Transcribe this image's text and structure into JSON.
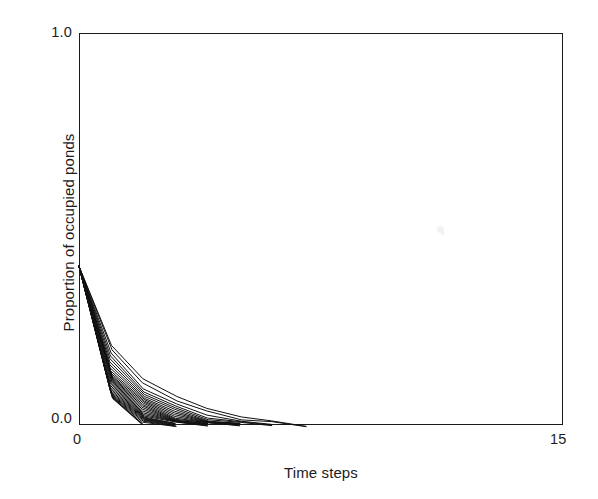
{
  "figure": {
    "background_color": "#ffffff",
    "ink_color": "#1a1a1a"
  },
  "axis": {
    "y_tick_top": "1.0",
    "y_tick_bottom": "0.0",
    "x_tick_left": "0",
    "x_tick_right": "15",
    "y_title": "Proportion of occupied ponds",
    "x_title": "Time steps"
  },
  "chart_data": {
    "type": "line",
    "title": "",
    "subtitle": "",
    "xlabel": "Time steps",
    "ylabel": "Proportion of occupied ponds",
    "xlim": [
      0,
      15
    ],
    "ylim": [
      0,
      1.0
    ],
    "x_ticks": [
      0,
      15
    ],
    "x_tick_labels": [
      "0",
      "15"
    ],
    "y_ticks": [
      0.0,
      1.0
    ],
    "y_tick_labels": [
      "0.0",
      "1.0"
    ],
    "grid": false,
    "legend": null,
    "legend_position": "none",
    "line_color": "#111111",
    "line_width": 1.0,
    "annotations": [],
    "x": [
      0,
      1,
      2,
      3,
      4,
      5,
      6,
      7,
      8,
      9,
      10,
      11,
      12,
      13,
      14,
      15
    ],
    "series": [
      {
        "name": "replicate 1",
        "values": [
          0.405,
          0.18,
          0.095,
          0.052,
          0.026,
          0.01,
          0.0,
          0,
          0,
          0,
          0,
          0,
          0,
          0,
          0,
          0
        ]
      },
      {
        "name": "replicate 2",
        "values": [
          0.405,
          0.172,
          0.088,
          0.045,
          0.02,
          0.007,
          0.0,
          0,
          0,
          0,
          0,
          0,
          0,
          0,
          0,
          0
        ]
      },
      {
        "name": "replicate 3",
        "values": [
          0.405,
          0.165,
          0.082,
          0.04,
          0.017,
          0.004,
          0.0,
          0,
          0,
          0,
          0,
          0,
          0,
          0,
          0,
          0
        ]
      },
      {
        "name": "replicate 4",
        "values": [
          0.405,
          0.158,
          0.076,
          0.036,
          0.014,
          0.0,
          0.0,
          0,
          0,
          0,
          0,
          0,
          0,
          0,
          0,
          0
        ]
      },
      {
        "name": "replicate 5",
        "values": [
          0.405,
          0.152,
          0.07,
          0.032,
          0.012,
          0.0,
          0.0,
          0,
          0,
          0,
          0,
          0,
          0,
          0,
          0,
          0
        ]
      },
      {
        "name": "replicate 6",
        "values": [
          0.405,
          0.146,
          0.065,
          0.029,
          0.01,
          0.0,
          0.0,
          0,
          0,
          0,
          0,
          0,
          0,
          0,
          0,
          0
        ]
      },
      {
        "name": "replicate 7",
        "values": [
          0.405,
          0.14,
          0.06,
          0.026,
          0.008,
          0.0,
          0.0,
          0,
          0,
          0,
          0,
          0,
          0,
          0,
          0,
          0
        ]
      },
      {
        "name": "replicate 8",
        "values": [
          0.405,
          0.135,
          0.056,
          0.023,
          0.006,
          0.0,
          0.0,
          0,
          0,
          0,
          0,
          0,
          0,
          0,
          0,
          0
        ]
      },
      {
        "name": "replicate 9",
        "values": [
          0.405,
          0.13,
          0.052,
          0.02,
          0.004,
          0.0,
          0.0,
          0,
          0,
          0,
          0,
          0,
          0,
          0,
          0,
          0
        ]
      },
      {
        "name": "replicate 10",
        "values": [
          0.405,
          0.126,
          0.048,
          0.018,
          0.003,
          0.0,
          0.0,
          0,
          0,
          0,
          0,
          0,
          0,
          0,
          0,
          0
        ]
      },
      {
        "name": "replicate 11",
        "values": [
          0.405,
          0.122,
          0.045,
          0.016,
          0.0,
          0.0,
          0.0,
          0,
          0,
          0,
          0,
          0,
          0,
          0,
          0,
          0
        ]
      },
      {
        "name": "replicate 12",
        "values": [
          0.405,
          0.118,
          0.042,
          0.014,
          0.0,
          0.0,
          0.0,
          0,
          0,
          0,
          0,
          0,
          0,
          0,
          0,
          0
        ]
      },
      {
        "name": "replicate 13",
        "values": [
          0.405,
          0.114,
          0.039,
          0.012,
          0.0,
          0.0,
          0.0,
          0,
          0,
          0,
          0,
          0,
          0,
          0,
          0,
          0
        ]
      },
      {
        "name": "replicate 14",
        "values": [
          0.405,
          0.11,
          0.036,
          0.01,
          0.0,
          0.0,
          0.0,
          0,
          0,
          0,
          0,
          0,
          0,
          0,
          0,
          0
        ]
      },
      {
        "name": "replicate 15",
        "values": [
          0.405,
          0.107,
          0.033,
          0.008,
          0.0,
          0.0,
          0.0,
          0,
          0,
          0,
          0,
          0,
          0,
          0,
          0,
          0
        ]
      },
      {
        "name": "replicate 16",
        "values": [
          0.405,
          0.104,
          0.03,
          0.006,
          0.0,
          0.0,
          0.0,
          0,
          0,
          0,
          0,
          0,
          0,
          0,
          0,
          0
        ]
      },
      {
        "name": "replicate 17",
        "values": [
          0.405,
          0.101,
          0.027,
          0.004,
          0.0,
          0.0,
          0.0,
          0,
          0,
          0,
          0,
          0,
          0,
          0,
          0,
          0
        ]
      },
      {
        "name": "replicate 18",
        "values": [
          0.405,
          0.098,
          0.024,
          0.0,
          0.0,
          0.0,
          0.0,
          0,
          0,
          0,
          0,
          0,
          0,
          0,
          0,
          0
        ]
      },
      {
        "name": "replicate 19",
        "values": [
          0.405,
          0.095,
          0.021,
          0.0,
          0.0,
          0.0,
          0.0,
          0,
          0,
          0,
          0,
          0,
          0,
          0,
          0,
          0
        ]
      },
      {
        "name": "replicate 20",
        "values": [
          0.405,
          0.092,
          0.018,
          0.0,
          0.0,
          0.0,
          0.0,
          0,
          0,
          0,
          0,
          0,
          0,
          0,
          0,
          0
        ]
      },
      {
        "name": "replicate 21",
        "values": [
          0.405,
          0.089,
          0.015,
          0.0,
          0.0,
          0.0,
          0.0,
          0,
          0,
          0,
          0,
          0,
          0,
          0,
          0,
          0
        ]
      },
      {
        "name": "replicate 22",
        "values": [
          0.405,
          0.086,
          0.012,
          0.0,
          0.0,
          0.0,
          0.0,
          0,
          0,
          0,
          0,
          0,
          0,
          0,
          0,
          0
        ]
      },
      {
        "name": "replicate 23",
        "values": [
          0.405,
          0.083,
          0.009,
          0.0,
          0.0,
          0.0,
          0.0,
          0,
          0,
          0,
          0,
          0,
          0,
          0,
          0,
          0
        ]
      },
      {
        "name": "replicate 24",
        "values": [
          0.405,
          0.08,
          0.006,
          0.0,
          0.0,
          0.0,
          0.0,
          0,
          0,
          0,
          0,
          0,
          0,
          0,
          0,
          0
        ]
      },
      {
        "name": "replicate 25",
        "values": [
          0.405,
          0.077,
          0.003,
          0.0,
          0.0,
          0.0,
          0.0,
          0,
          0,
          0,
          0,
          0,
          0,
          0,
          0,
          0
        ]
      },
      {
        "name": "replicate 26",
        "values": [
          0.405,
          0.074,
          0.0,
          0.0,
          0.0,
          0.0,
          0.0,
          0,
          0,
          0,
          0,
          0,
          0,
          0,
          0,
          0
        ]
      },
      {
        "name": "replicate 27",
        "values": [
          0.405,
          0.071,
          0.0,
          0.0,
          0.0,
          0.0,
          0.0,
          0,
          0,
          0,
          0,
          0,
          0,
          0,
          0,
          0
        ]
      },
      {
        "name": "replicate 28",
        "values": [
          0.405,
          0.068,
          0.0,
          0.0,
          0.0,
          0.0,
          0.0,
          0,
          0,
          0,
          0,
          0,
          0,
          0,
          0,
          0
        ]
      },
      {
        "name": "replicate 29",
        "values": [
          0.405,
          0.19,
          0.108,
          0.062,
          0.034,
          0.016,
          0.005,
          0,
          0,
          0,
          0,
          0,
          0,
          0,
          0,
          0
        ]
      },
      {
        "name": "replicate 30",
        "values": [
          0.405,
          0.2,
          0.12,
          0.072,
          0.042,
          0.022,
          0.008,
          0,
          0,
          0,
          0,
          0,
          0,
          0,
          0,
          0
        ]
      }
    ]
  }
}
